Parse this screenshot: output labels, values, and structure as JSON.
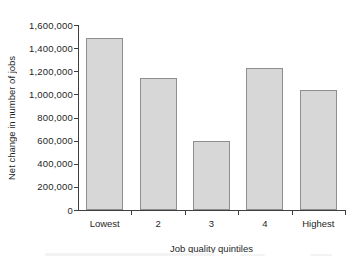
{
  "chart_data": {
    "type": "bar",
    "title": "",
    "categories": [
      "Lowest",
      "2",
      "3",
      "4",
      "Highest"
    ],
    "values": [
      1490000,
      1140000,
      600000,
      1230000,
      1040000
    ],
    "xlabel": "Job quality quintiles",
    "ylabel": "Net change in number of jobs",
    "ylim": [
      0,
      1600000
    ],
    "ytick_step": 200000,
    "ytick_labels": [
      "0",
      "200,000",
      "400,000",
      "600,000",
      "800,000",
      "1,000,000",
      "1,200,000",
      "1,400,000",
      "1,600,000"
    ],
    "grid": false,
    "legend": "none",
    "bar_fill_color": "#d7d7d7",
    "bar_border_color": "#8e8e8e",
    "axis_color": "#3f3f3f",
    "text_color": "#1f1f1f"
  }
}
